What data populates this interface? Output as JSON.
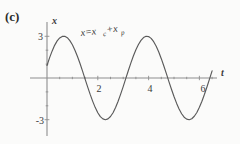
{
  "panel": {
    "label": "(c)"
  },
  "annotation": {
    "full": "x=x_c+x_p",
    "lead": "x=x",
    "sub1": "c",
    "plus": "+x",
    "sub2": "p"
  },
  "chart_data": {
    "type": "line",
    "title": "",
    "subtitle": "",
    "xlabel": "t",
    "ylabel": "x",
    "xlim": [
      -0.35,
      6.9
    ],
    "ylim": [
      -4.2,
      4.0
    ],
    "xticks": [
      2,
      4,
      6
    ],
    "xtick_labels": [
      "2",
      "4",
      "6"
    ],
    "yticks": [
      3,
      -3
    ],
    "ytick_labels": [
      "3",
      "-3"
    ],
    "grid": false,
    "legend": null,
    "annotations": [
      {
        "text": "x=x_c+x_p",
        "x": 1.35,
        "y": 3.45
      }
    ],
    "series": [
      {
        "name": "x=x_c+x_p",
        "color": "#5a5a5a",
        "amplitude": 3,
        "omega": 2.02,
        "phase_deg": 17.5,
        "x": [
          0,
          0.1,
          0.2,
          0.3,
          0.4,
          0.5,
          0.6,
          0.7,
          0.8,
          0.9,
          1.0,
          1.1,
          1.2,
          1.3,
          1.4,
          1.5,
          1.6,
          1.7,
          1.8,
          1.9,
          2.0,
          2.1,
          2.2,
          2.3,
          2.4,
          2.5,
          2.6,
          2.7,
          2.8,
          2.9,
          3.0,
          3.1,
          3.2,
          3.3,
          3.4,
          3.5,
          3.6,
          3.7,
          3.8,
          3.9,
          4.0,
          4.1,
          4.2,
          4.3,
          4.4,
          4.5,
          4.6,
          4.7,
          4.8,
          4.9,
          5.0,
          5.1,
          5.2,
          5.3,
          5.4,
          5.5,
          5.6,
          5.7,
          5.8,
          5.9,
          6.0,
          6.1,
          6.2,
          6.3,
          6.4,
          6.5
        ],
        "y": [
          0.9,
          1.45,
          1.93,
          2.35,
          2.67,
          2.88,
          2.99,
          3.0,
          2.9,
          2.69,
          2.39,
          2.0,
          1.55,
          1.04,
          0.49,
          -0.08,
          -0.64,
          -1.18,
          -1.68,
          -2.13,
          -2.5,
          -2.78,
          -2.94,
          -3.0,
          -2.94,
          -2.77,
          -2.5,
          -2.12,
          -1.67,
          -1.16,
          -0.62,
          -0.05,
          0.52,
          1.07,
          1.58,
          2.03,
          2.41,
          2.71,
          2.91,
          3.0,
          2.98,
          2.85,
          2.61,
          2.28,
          1.87,
          1.39,
          0.86,
          0.31,
          -0.26,
          -0.81,
          -1.33,
          -1.81,
          -2.23,
          -2.57,
          -2.82,
          -2.96,
          -3.0,
          -2.93,
          -2.75,
          -2.48,
          -2.11,
          -1.67,
          -1.17,
          -0.63,
          -0.06,
          0.51
        ]
      }
    ]
  },
  "axis_geometry": {
    "origin_px": {
      "x": 47,
      "y": 78
    },
    "x_scale_px_per_unit": 25.4,
    "y_scale_px_per_unit": 13.9,
    "y_axis_top_px": 22,
    "y_axis_bottom_px": 136,
    "x_axis_left_px": 30,
    "x_axis_right_px": 217
  },
  "colors": {
    "background": "#fbfbfa",
    "axis": "#8d8d8d",
    "curve": "#5a5a5a",
    "text": "#2b2b2b"
  }
}
